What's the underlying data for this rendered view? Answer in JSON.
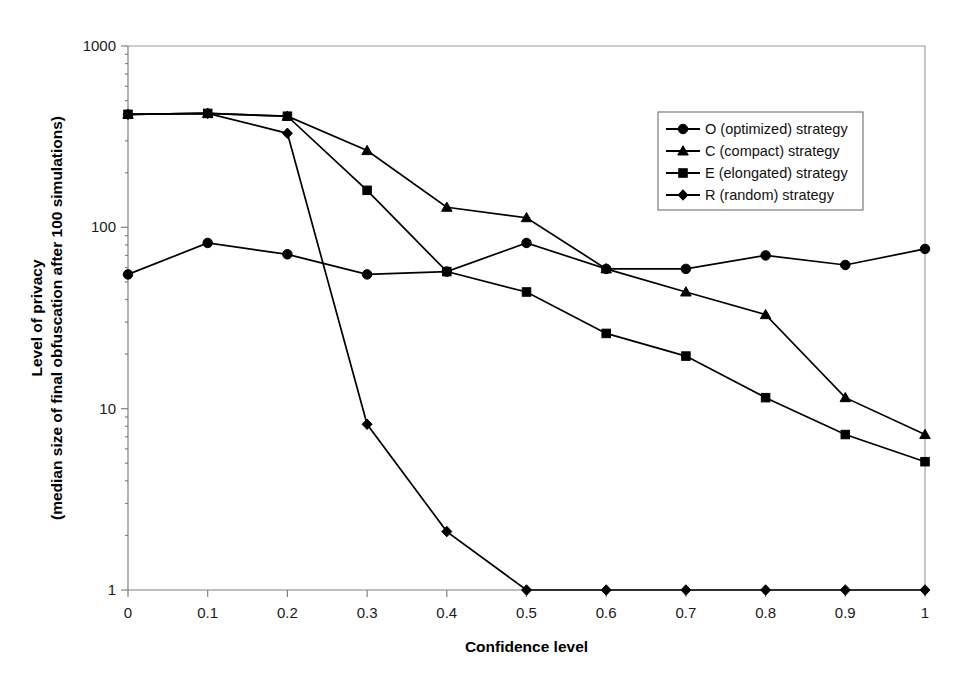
{
  "chart_data": {
    "type": "line",
    "title": "",
    "xlabel": "Confidence level",
    "ylabel_line1": "Level of privacy",
    "ylabel_line2": "(median size of final obfuscation after 100 simulations)",
    "x": [
      0,
      0.1,
      0.2,
      0.3,
      0.4,
      0.5,
      0.6,
      0.7,
      0.8,
      0.9,
      1
    ],
    "xtick_labels": [
      "0",
      "0.1",
      "0.2",
      "0.3",
      "0.4",
      "0.5",
      "0.6",
      "0.7",
      "0.8",
      "0.9",
      "1"
    ],
    "ytick_labels": [
      "1",
      "10",
      "100",
      "1000"
    ],
    "ytick_values": [
      1,
      10,
      100,
      1000
    ],
    "yscale": "log",
    "ylim": [
      1,
      1000
    ],
    "xlim": [
      0,
      1
    ],
    "grid": false,
    "legend_position": "upper right",
    "series": [
      {
        "name": "O (optimized) strategy",
        "marker": "circle",
        "color": "#000000",
        "values": [
          55,
          82,
          71,
          55,
          57,
          82,
          59,
          59,
          70,
          62,
          76
        ]
      },
      {
        "name": "C (compact) strategy",
        "marker": "triangle",
        "color": "#000000",
        "values": [
          420,
          425,
          410,
          265,
          129,
          113,
          59,
          44,
          33,
          11.5,
          7.2
        ]
      },
      {
        "name": "E (elongated) strategy",
        "marker": "square",
        "color": "#000000",
        "values": [
          420,
          425,
          410,
          160,
          57,
          44,
          26,
          19.5,
          11.5,
          7.2,
          5.1
        ]
      },
      {
        "name": "R (random) strategy",
        "marker": "diamond",
        "color": "#000000",
        "values": [
          420,
          425,
          330,
          8.2,
          2.1,
          1,
          1,
          1,
          1,
          1,
          1
        ]
      }
    ]
  }
}
